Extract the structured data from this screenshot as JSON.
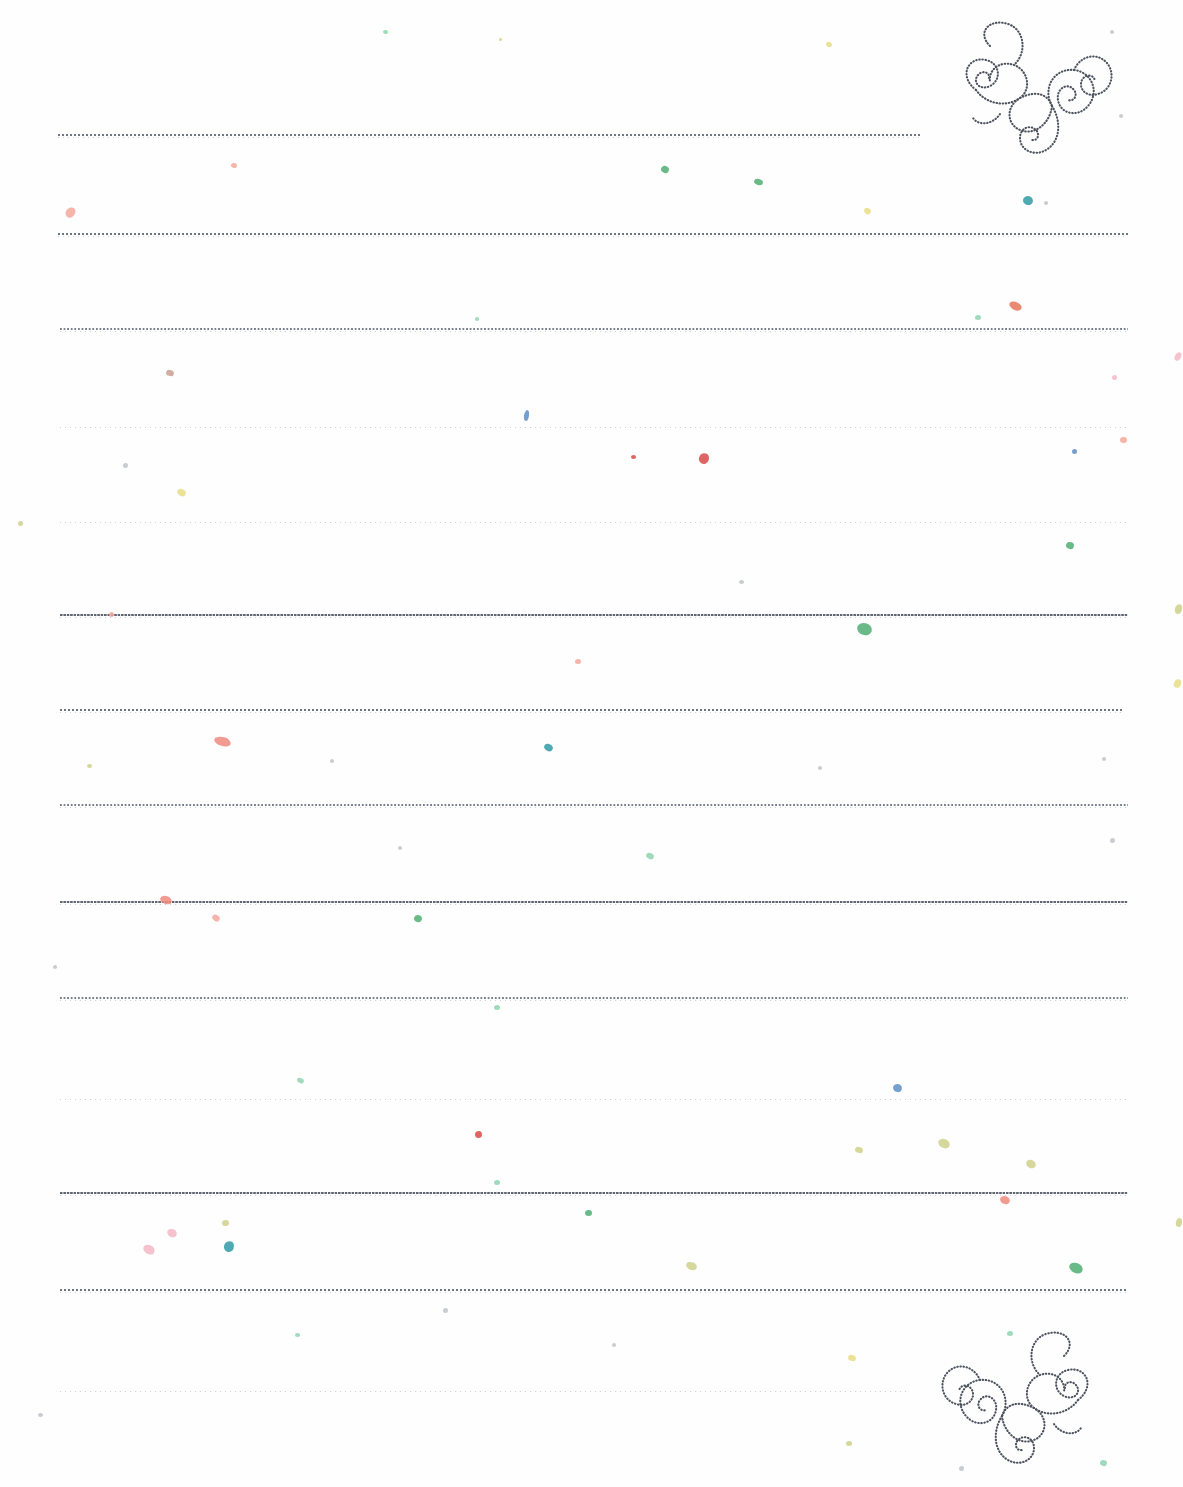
{
  "document": {
    "type": "lined-stationery-template",
    "title": "Decorative Lined Writing Paper",
    "background_color": "#fefeff",
    "page_width": 1183,
    "page_height": 1487
  },
  "ornaments": [
    {
      "name": "swirl-flourish-top-right",
      "position": "top-right",
      "x": 928,
      "y": 18,
      "width": 190,
      "height": 150,
      "color": "#4d535e",
      "style": "dotted-spiral-scroll"
    },
    {
      "name": "swirl-flourish-bottom-right",
      "position": "bottom-right",
      "x": 936,
      "y": 1328,
      "width": 190,
      "height": 150,
      "color": "#4d535e",
      "style": "dotted-spiral-scroll"
    }
  ],
  "rules": [
    {
      "y": 134,
      "x": 58,
      "width": 862,
      "style": "styleA"
    },
    {
      "y": 233,
      "x": 58,
      "width": 1070,
      "style": "styleA"
    },
    {
      "y": 328,
      "x": 60,
      "width": 1068,
      "style": "styleD"
    },
    {
      "y": 424,
      "x": 60,
      "width": 1068,
      "style": "styleC"
    },
    {
      "y": 519,
      "x": 60,
      "width": 1068,
      "style": "styleC"
    },
    {
      "y": 614,
      "x": 60,
      "width": 1068,
      "style": "styleB"
    },
    {
      "y": 709,
      "x": 60,
      "width": 1062,
      "style": "styleA"
    },
    {
      "y": 804,
      "x": 60,
      "width": 1068,
      "style": "styleD"
    },
    {
      "y": 901,
      "x": 60,
      "width": 1068,
      "style": "styleB"
    },
    {
      "y": 997,
      "x": 60,
      "width": 1068,
      "style": "styleD"
    },
    {
      "y": 1096,
      "x": 60,
      "width": 1068,
      "style": "styleC"
    },
    {
      "y": 1192,
      "x": 60,
      "width": 1068,
      "style": "styleB"
    },
    {
      "y": 1289,
      "x": 60,
      "width": 1068,
      "style": "styleA"
    },
    {
      "y": 1388,
      "x": 60,
      "width": 848,
      "style": "styleC"
    }
  ],
  "speckle_palette": {
    "red": "#d94a4a",
    "coral": "#f08a7e",
    "salmon": "#f4a79b",
    "green": "#4fae72",
    "mint": "#8fd4b0",
    "teal": "#2f9aa6",
    "blue": "#5d8fc4",
    "yellow": "#e8dd86",
    "olive": "#cfd08a",
    "pink": "#f3b9c6",
    "grey": "#bfc3c9"
  },
  "speckles": [
    {
      "x": 383,
      "y": 30,
      "w": 5,
      "h": 4,
      "c": "#8fd4b0",
      "r": 12
    },
    {
      "x": 826,
      "y": 42,
      "w": 6,
      "h": 5,
      "c": "#e8dd86",
      "r": 30
    },
    {
      "x": 1110,
      "y": 30,
      "w": 4,
      "h": 4,
      "c": "#bfc3c9",
      "r": 0
    },
    {
      "x": 499,
      "y": 38,
      "w": 3,
      "h": 3,
      "c": "#cfd08a",
      "r": 0
    },
    {
      "x": 231,
      "y": 163,
      "w": 6,
      "h": 5,
      "c": "#f4a79b",
      "r": 20
    },
    {
      "x": 661,
      "y": 166,
      "w": 8,
      "h": 7,
      "c": "#4fae72",
      "r": 35
    },
    {
      "x": 754,
      "y": 179,
      "w": 9,
      "h": 6,
      "c": "#4fae72",
      "r": 15
    },
    {
      "x": 864,
      "y": 208,
      "w": 7,
      "h": 6,
      "c": "#e8dd86",
      "r": 40
    },
    {
      "x": 1023,
      "y": 196,
      "w": 10,
      "h": 9,
      "c": "#2f9aa6",
      "r": 10
    },
    {
      "x": 1044,
      "y": 201,
      "w": 4,
      "h": 4,
      "c": "#bfc3c9",
      "r": 0
    },
    {
      "x": 1119,
      "y": 114,
      "w": 4,
      "h": 4,
      "c": "#bfc3c9",
      "r": 0
    },
    {
      "x": 66,
      "y": 207,
      "w": 9,
      "h": 11,
      "c": "#f4a79b",
      "r": 40
    },
    {
      "x": 1009,
      "y": 302,
      "w": 13,
      "h": 8,
      "c": "#e8755a",
      "r": 25
    },
    {
      "x": 975,
      "y": 315,
      "w": 6,
      "h": 5,
      "c": "#8fd4b0",
      "r": 0
    },
    {
      "x": 475,
      "y": 317,
      "w": 4,
      "h": 4,
      "c": "#8fd4b0",
      "r": 0
    },
    {
      "x": 166,
      "y": 370,
      "w": 8,
      "h": 6,
      "c": "#c9a090",
      "r": 20
    },
    {
      "x": 1112,
      "y": 375,
      "w": 5,
      "h": 5,
      "c": "#f3b9c6",
      "r": 0
    },
    {
      "x": 1175,
      "y": 352,
      "w": 6,
      "h": 9,
      "c": "#f3b9c6",
      "r": 30
    },
    {
      "x": 524,
      "y": 410,
      "w": 5,
      "h": 11,
      "c": "#5d8fc4",
      "r": 10
    },
    {
      "x": 1120,
      "y": 437,
      "w": 7,
      "h": 6,
      "c": "#f4a79b",
      "r": 0
    },
    {
      "x": 1072,
      "y": 449,
      "w": 5,
      "h": 5,
      "c": "#5d8fc4",
      "r": 0
    },
    {
      "x": 631,
      "y": 455,
      "w": 5,
      "h": 4,
      "c": "#d94a4a",
      "r": 0
    },
    {
      "x": 699,
      "y": 453,
      "w": 10,
      "h": 11,
      "c": "#d94a4a",
      "r": 25
    },
    {
      "x": 123,
      "y": 463,
      "w": 5,
      "h": 5,
      "c": "#bfc3c9",
      "r": 0
    },
    {
      "x": 177,
      "y": 489,
      "w": 9,
      "h": 7,
      "c": "#e8dd86",
      "r": 30
    },
    {
      "x": 18,
      "y": 521,
      "w": 5,
      "h": 5,
      "c": "#cfd08a",
      "r": 0
    },
    {
      "x": 1066,
      "y": 542,
      "w": 8,
      "h": 7,
      "c": "#4fae72",
      "r": 20
    },
    {
      "x": 739,
      "y": 580,
      "w": 5,
      "h": 4,
      "c": "#bfc3c9",
      "r": 0
    },
    {
      "x": 109,
      "y": 612,
      "w": 5,
      "h": 5,
      "c": "#f4a79b",
      "r": 0
    },
    {
      "x": 857,
      "y": 623,
      "w": 15,
      "h": 12,
      "c": "#4fae72",
      "r": 15
    },
    {
      "x": 1175,
      "y": 604,
      "w": 7,
      "h": 10,
      "c": "#cfd08a",
      "r": 20
    },
    {
      "x": 575,
      "y": 659,
      "w": 6,
      "h": 5,
      "c": "#f4a79b",
      "r": 0
    },
    {
      "x": 1174,
      "y": 679,
      "w": 7,
      "h": 9,
      "c": "#e8dd86",
      "r": 25
    },
    {
      "x": 214,
      "y": 737,
      "w": 17,
      "h": 9,
      "c": "#f08a7e",
      "r": 15
    },
    {
      "x": 544,
      "y": 744,
      "w": 9,
      "h": 7,
      "c": "#2f9aa6",
      "r": 30
    },
    {
      "x": 330,
      "y": 759,
      "w": 4,
      "h": 4,
      "c": "#bfc3c9",
      "r": 0
    },
    {
      "x": 87,
      "y": 764,
      "w": 5,
      "h": 4,
      "c": "#cfd08a",
      "r": 0
    },
    {
      "x": 818,
      "y": 766,
      "w": 4,
      "h": 4,
      "c": "#bfc3c9",
      "r": 0
    },
    {
      "x": 1102,
      "y": 757,
      "w": 4,
      "h": 4,
      "c": "#bfc3c9",
      "r": 0
    },
    {
      "x": 398,
      "y": 846,
      "w": 4,
      "h": 4,
      "c": "#bfc3c9",
      "r": 0
    },
    {
      "x": 646,
      "y": 853,
      "w": 8,
      "h": 6,
      "c": "#8fd4b0",
      "r": 25
    },
    {
      "x": 1110,
      "y": 838,
      "w": 5,
      "h": 5,
      "c": "#bfc3c9",
      "r": 0
    },
    {
      "x": 160,
      "y": 896,
      "w": 12,
      "h": 8,
      "c": "#f08a7e",
      "r": 20
    },
    {
      "x": 212,
      "y": 915,
      "w": 8,
      "h": 6,
      "c": "#f4a79b",
      "r": 35
    },
    {
      "x": 414,
      "y": 915,
      "w": 8,
      "h": 7,
      "c": "#4fae72",
      "r": 15
    },
    {
      "x": 53,
      "y": 965,
      "w": 4,
      "h": 4,
      "c": "#bfc3c9",
      "r": 0
    },
    {
      "x": 494,
      "y": 1005,
      "w": 6,
      "h": 5,
      "c": "#8fd4b0",
      "r": 0
    },
    {
      "x": 297,
      "y": 1078,
      "w": 7,
      "h": 5,
      "c": "#8fd4b0",
      "r": 25
    },
    {
      "x": 893,
      "y": 1084,
      "w": 9,
      "h": 8,
      "c": "#5d8fc4",
      "r": 15
    },
    {
      "x": 475,
      "y": 1131,
      "w": 7,
      "h": 7,
      "c": "#d94a4a",
      "r": 0
    },
    {
      "x": 855,
      "y": 1147,
      "w": 8,
      "h": 6,
      "c": "#cfd08a",
      "r": 20
    },
    {
      "x": 938,
      "y": 1139,
      "w": 12,
      "h": 9,
      "c": "#cfd08a",
      "r": 25
    },
    {
      "x": 1026,
      "y": 1160,
      "w": 10,
      "h": 8,
      "c": "#cfd08a",
      "r": 30
    },
    {
      "x": 494,
      "y": 1180,
      "w": 6,
      "h": 5,
      "c": "#8fd4b0",
      "r": 0
    },
    {
      "x": 1000,
      "y": 1196,
      "w": 10,
      "h": 8,
      "c": "#f08a7e",
      "r": 20
    },
    {
      "x": 585,
      "y": 1210,
      "w": 7,
      "h": 6,
      "c": "#4fae72",
      "r": 0
    },
    {
      "x": 167,
      "y": 1229,
      "w": 10,
      "h": 8,
      "c": "#f3b9c6",
      "r": 25
    },
    {
      "x": 222,
      "y": 1220,
      "w": 7,
      "h": 6,
      "c": "#cfd08a",
      "r": 0
    },
    {
      "x": 224,
      "y": 1241,
      "w": 10,
      "h": 11,
      "c": "#2f9aa6",
      "r": 20
    },
    {
      "x": 143,
      "y": 1245,
      "w": 12,
      "h": 9,
      "c": "#f3b9c6",
      "r": 30
    },
    {
      "x": 686,
      "y": 1262,
      "w": 11,
      "h": 8,
      "c": "#cfd08a",
      "r": 20
    },
    {
      "x": 1069,
      "y": 1263,
      "w": 14,
      "h": 10,
      "c": "#4fae72",
      "r": 25
    },
    {
      "x": 1176,
      "y": 1218,
      "w": 6,
      "h": 9,
      "c": "#cfd08a",
      "r": 15
    },
    {
      "x": 443,
      "y": 1308,
      "w": 5,
      "h": 5,
      "c": "#bfc3c9",
      "r": 0
    },
    {
      "x": 295,
      "y": 1333,
      "w": 5,
      "h": 4,
      "c": "#8fd4b0",
      "r": 0
    },
    {
      "x": 612,
      "y": 1343,
      "w": 4,
      "h": 4,
      "c": "#bfc3c9",
      "r": 0
    },
    {
      "x": 848,
      "y": 1355,
      "w": 8,
      "h": 6,
      "c": "#e8dd86",
      "r": 20
    },
    {
      "x": 38,
      "y": 1413,
      "w": 5,
      "h": 4,
      "c": "#bfc3c9",
      "r": 0
    },
    {
      "x": 846,
      "y": 1441,
      "w": 6,
      "h": 5,
      "c": "#cfd08a",
      "r": 0
    },
    {
      "x": 1100,
      "y": 1460,
      "w": 7,
      "h": 6,
      "c": "#8fd4b0",
      "r": 20
    },
    {
      "x": 959,
      "y": 1466,
      "w": 5,
      "h": 5,
      "c": "#bfc3c9",
      "r": 0
    },
    {
      "x": 1007,
      "y": 1331,
      "w": 6,
      "h": 5,
      "c": "#8fd4b0",
      "r": 0
    }
  ]
}
